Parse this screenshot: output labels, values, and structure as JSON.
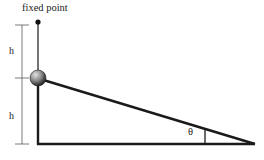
{
  "diagram": {
    "canvas": {
      "width": 264,
      "height": 160,
      "background": "#ffffff"
    },
    "labels": {
      "fixed_point": "fixed point",
      "height_upper": "h",
      "height_lower": "h",
      "angle": "θ"
    },
    "colors": {
      "stroke": "#1a1a1a",
      "dimension": "#555555",
      "ball_light": "#d8d8d8",
      "ball_mid": "#8a8a8a",
      "ball_dark": "#2b2b2b",
      "text": "#1a1a1a"
    },
    "geometry": {
      "pivot_point": {
        "x": 38,
        "y": 22
      },
      "ball_center": {
        "x": 38,
        "y": 78
      },
      "ball_radius": 8,
      "base_left": {
        "x": 38,
        "y": 144
      },
      "base_right": {
        "x": 255,
        "y": 144
      },
      "angle_tick": {
        "x": 205,
        "y_top": 130,
        "y_bottom": 144
      },
      "dimension_axis_x": 22,
      "dimension_ticks_y": [
        25,
        78,
        144
      ]
    },
    "icons": {
      "pivot": "filled-dot-icon",
      "bob": "sphere-icon"
    }
  }
}
